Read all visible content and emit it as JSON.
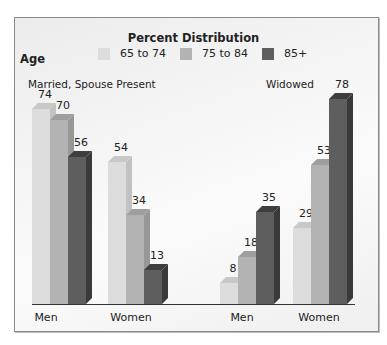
{
  "chart_data": {
    "type": "bar",
    "title": "Percent Distribution",
    "legend_title": "Age",
    "legend": [
      "65 to 74",
      "75 to 84",
      "85+"
    ],
    "groups": [
      {
        "label": "Married, Spouse Present",
        "categories": [
          "Men",
          "Women"
        ]
      },
      {
        "label": "Widowed",
        "categories": [
          "Men",
          "Women"
        ]
      }
    ],
    "categories": [
      "Married Men",
      "Married Women",
      "Widowed Men",
      "Widowed Women"
    ],
    "series": [
      {
        "name": "65 to 74",
        "values": [
          74,
          54,
          8,
          29
        ]
      },
      {
        "name": "75 to 84",
        "values": [
          70,
          34,
          18,
          53
        ]
      },
      {
        "name": "85+",
        "values": [
          56,
          13,
          35,
          78
        ]
      }
    ],
    "xlabel": "",
    "ylabel": "",
    "ylim": [
      0,
      80
    ],
    "grid": false,
    "legend_position": "top"
  },
  "colors": {
    "s1_front": "#dcdcdc",
    "s1_top": "#c8c8c8",
    "s1_side": "#c2c2c2",
    "s2_front": "#b3b3b3",
    "s2_top": "#9e9e9e",
    "s2_side": "#979797",
    "s3_front": "#5e5e5e",
    "s3_top": "#3e3e3e",
    "s3_side": "#3a3a3a"
  },
  "labels": {
    "title": "Percent Distribution",
    "age": "Age",
    "legend_1": "65 to 74",
    "legend_2": "75 to 84",
    "legend_3": "85+",
    "group_married": "Married, Spouse Present",
    "group_widowed": "Widowed",
    "x_men_1": "Men",
    "x_women_1": "Women",
    "x_men_2": "Men",
    "x_women_2": "Women"
  }
}
